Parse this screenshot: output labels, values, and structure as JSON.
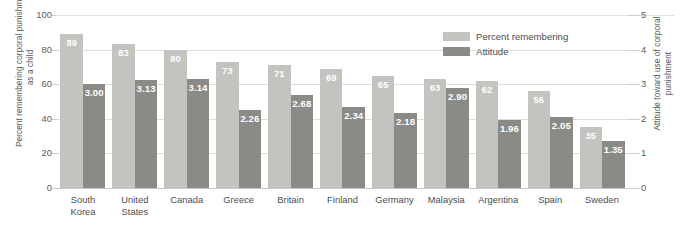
{
  "chart_data": {
    "type": "bar",
    "title": "",
    "subtitle": "",
    "xlabel": "",
    "ylabel": "Percent remembering corporal punishment as a child",
    "y2label": "Attitude toward use of corporal punishment",
    "categories": [
      "South\nKorea",
      "United\nStates",
      "Canada",
      "Greece",
      "Britain",
      "Finland",
      "Germany",
      "Malaysia",
      "Argentina",
      "Spain",
      "Sweden"
    ],
    "series": [
      {
        "name": "Percent remembering",
        "axis": "left",
        "color": "#c3c3bf",
        "values": [
          89,
          83,
          80,
          73,
          71,
          69,
          65,
          63,
          62,
          56,
          35
        ],
        "labels": [
          "89",
          "83",
          "80",
          "73",
          "71",
          "69",
          "65",
          "63",
          "62",
          "56",
          "35"
        ]
      },
      {
        "name": "Attitude",
        "axis": "right",
        "color": "#8a8a86",
        "values": [
          3.0,
          3.13,
          3.14,
          2.26,
          2.68,
          2.34,
          2.18,
          2.9,
          1.96,
          2.05,
          1.35
        ],
        "labels": [
          "3.00",
          "3.13",
          "3.14",
          "2.26",
          "2.68",
          "2.34",
          "2.18",
          "2.90",
          "1.96",
          "2.05",
          "1.35"
        ]
      }
    ],
    "ylim": [
      0,
      100
    ],
    "y2lim": [
      0,
      5
    ],
    "yticks": [
      "0",
      "20",
      "40",
      "60",
      "80",
      "100"
    ],
    "y2ticks": [
      "0",
      "1",
      "2",
      "3",
      "4",
      "5"
    ],
    "grid": true,
    "legend_position": "top-right",
    "legend": [
      "Percent remembering",
      "Attitude"
    ]
  }
}
